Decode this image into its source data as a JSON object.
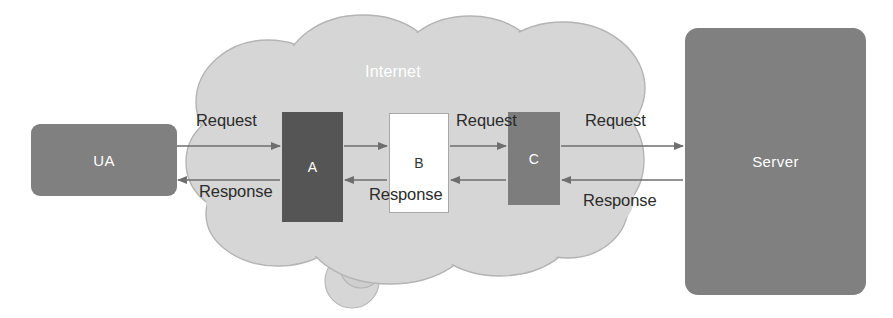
{
  "diagram": {
    "cloud": {
      "label": "Internet",
      "fill": "#d6d6d6",
      "stroke": "#b4b4b4"
    },
    "nodes": [
      {
        "id": "ua",
        "label": "UA",
        "fill": "#808080",
        "text_color": "#ffffff",
        "shape": "rounded-rect"
      },
      {
        "id": "a",
        "label": "A",
        "fill": "#555555",
        "text_color": "#ffffff",
        "shape": "rect"
      },
      {
        "id": "b",
        "label": "B",
        "fill": "#ffffff",
        "text_color": "#333333",
        "shape": "rect"
      },
      {
        "id": "c",
        "label": "C",
        "fill": "#7d7d7d",
        "text_color": "#ffffff",
        "shape": "rect"
      },
      {
        "id": "server",
        "label": "Server",
        "fill": "#808080",
        "text_color": "#ffffff",
        "shape": "rounded-rect"
      }
    ],
    "edges": [
      {
        "id": "req1",
        "label": "Request",
        "from": "ua",
        "to": "a",
        "direction": "right"
      },
      {
        "id": "req2",
        "label": "Request",
        "from": "b",
        "to": "c",
        "direction": "right"
      },
      {
        "id": "req3",
        "label": "Request",
        "from": "c",
        "to": "server",
        "direction": "right"
      },
      {
        "id": "res1",
        "label": "Response",
        "from": "a",
        "to": "ua",
        "direction": "left"
      },
      {
        "id": "res2",
        "label": "Response",
        "from": "c",
        "to": "b",
        "direction": "left"
      },
      {
        "id": "res3",
        "label": "Response",
        "from": "server",
        "to": "c",
        "direction": "left"
      }
    ],
    "line_color": "#6e6e6e"
  }
}
